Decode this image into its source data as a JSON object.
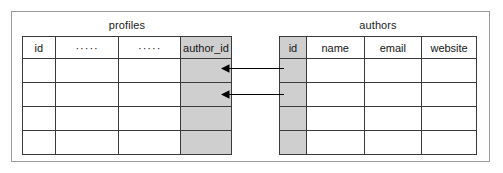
{
  "diagram": {
    "title": "",
    "frame": {
      "name": "er-diagram-frame"
    },
    "tables": [
      {
        "id": "profiles",
        "title": "profiles",
        "columns": [
          {
            "label": "id",
            "shaded": false,
            "kind": "primary-key"
          },
          {
            "label": "·····",
            "shaded": false,
            "kind": "ellipsis"
          },
          {
            "label": "·····",
            "shaded": false,
            "kind": "ellipsis"
          },
          {
            "label": "author_id",
            "shaded": true,
            "kind": "foreign-key"
          }
        ],
        "rows": 4
      },
      {
        "id": "authors",
        "title": "authors",
        "columns": [
          {
            "label": "id",
            "shaded": true,
            "kind": "primary-key"
          },
          {
            "label": "name",
            "shaded": false,
            "kind": "field"
          },
          {
            "label": "email",
            "shaded": false,
            "kind": "field"
          },
          {
            "label": "website",
            "shaded": false,
            "kind": "field"
          }
        ],
        "rows": 4
      }
    ],
    "relationships": [
      {
        "name": "relation-arrow-row-1",
        "from": "authors.id",
        "to": "profiles.author_id",
        "row": 1
      },
      {
        "name": "relation-arrow-row-2",
        "from": "authors.id",
        "to": "profiles.author_id",
        "row": 2
      }
    ]
  },
  "colors": {
    "shaded_cell": "#cfcfcf",
    "border": "#3a3a3a",
    "frame_border": "#9a9a9a",
    "text": "#151515",
    "arrow": "#000000",
    "background": "#ffffff"
  }
}
